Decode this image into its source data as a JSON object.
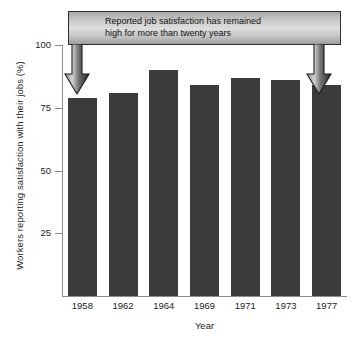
{
  "chart_data": {
    "type": "bar",
    "title": "",
    "categories": [
      "1958",
      "1962",
      "1964",
      "1969",
      "1971",
      "1973",
      "1977"
    ],
    "values": [
      79,
      81,
      90,
      84,
      87,
      86,
      84
    ],
    "xlabel": "Year",
    "ylabel": "Workers reporting satisfaction with their jobs (%)",
    "ylim": [
      0,
      100
    ],
    "ytick_labels": [
      "25",
      "50",
      "75",
      "100"
    ],
    "ytick_values": [
      25,
      50,
      75,
      100
    ],
    "grid": false,
    "legend": null,
    "bar_color": "#3b3b3b",
    "annotations": [
      {
        "name": "callout",
        "text": "Reported job satisfaction has remained\nhigh for more than twenty years",
        "points_to": [
          "1958",
          "1977"
        ]
      }
    ]
  },
  "callout": {
    "text": "Reported job satisfaction has remained\nhigh for more than twenty years"
  },
  "axes": {
    "xlabel": "Year",
    "ylabel": "Workers reporting satisfaction with their jobs (%)"
  }
}
